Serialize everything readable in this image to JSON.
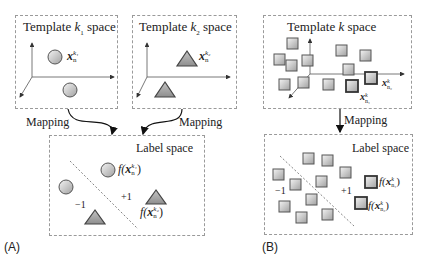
{
  "panelA": {
    "label": "(A)",
    "template1": {
      "title_prefix": "Template ",
      "title_var": "k",
      "title_sub": "1",
      "title_suffix": " space",
      "point_var": "x",
      "point_sub": "n",
      "point_sup": "k₁"
    },
    "template2": {
      "title_prefix": "Template ",
      "title_var": "k",
      "title_sub": "2",
      "title_suffix": " space",
      "point_var": "x",
      "point_sub": "n",
      "point_sup": "k₂"
    },
    "mapping_left": "Mapping",
    "mapping_right": "Mapping",
    "label_space": {
      "title": "Label space",
      "neg": "−1",
      "pos": "+1",
      "f1": "f(",
      "f1_var": "x",
      "f1_sub": "n",
      "f1_sup": "k₁",
      "f1_close": ")",
      "f2": "f(",
      "f2_var": "x",
      "f2_sub": "n",
      "f2_sup": "k₂",
      "f2_close": ")"
    }
  },
  "panelB": {
    "label": "(B)",
    "template": {
      "title_prefix": "Template ",
      "title_var": "k",
      "title_suffix": " space",
      "p1_var": "x",
      "p1_sub": "n₁",
      "p1_sup": "k",
      "p2_var": "x",
      "p2_sub": "n₂",
      "p2_sup": "k"
    },
    "mapping": "Mapping",
    "label_space": {
      "title": "Label space",
      "neg": "−1",
      "pos": "+1",
      "f1": "f(",
      "f1_var": "x",
      "f1_sub": "n₁",
      "f1_sup": "k",
      "f1_close": ")",
      "f2": "f(",
      "f2_var": "x",
      "f2_sub": "n₂",
      "f2_sup": "k",
      "f2_close": ")"
    }
  },
  "colors": {
    "shape_fill_light": "#f2f2f2",
    "shape_fill_dark": "#9c9c9c",
    "shape_stroke": "#555555",
    "box_border": "#9a9a9a"
  }
}
